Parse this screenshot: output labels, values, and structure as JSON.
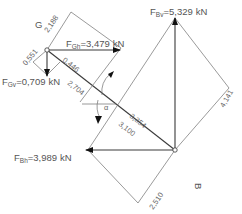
{
  "points": {
    "G": {
      "label": "G"
    },
    "B": {
      "label": "B"
    }
  },
  "forces": {
    "F_Gh": {
      "symbol": "F",
      "sub": "Gh",
      "value": "=3,479",
      "unit": "kN"
    },
    "F_Gv": {
      "symbol": "F",
      "sub": "Gv",
      "value": "=0,709",
      "unit": "kN"
    },
    "F_Bv": {
      "symbol": "F",
      "sub": "Bv",
      "value": "=5,329",
      "unit": "kN"
    },
    "F_Bh": {
      "symbol": "F",
      "sub": "Bh",
      "value": "=3,989",
      "unit": "kN"
    }
  },
  "dimensions": {
    "d_2188": "2,188",
    "d_0551": "0,551",
    "d_0446": "0,446",
    "d_2704": "2,704",
    "d_3354": "3,354",
    "d_3100": "3,100",
    "d_4141": "4,141",
    "d_2510": "2,510"
  },
  "angle": {
    "label": "α"
  }
}
